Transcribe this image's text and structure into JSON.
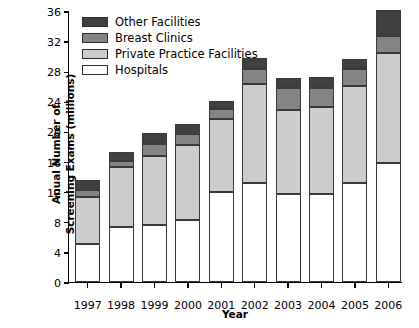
{
  "chart_data": {
    "type": "bar",
    "subtype": "stacked-vertical",
    "title": "",
    "xlabel": "Year",
    "ylabel": "Anual Number of\nScreening Exams (millions)",
    "categories": [
      "1997",
      "1998",
      "1999",
      "2000",
      "2001",
      "2002",
      "2003",
      "2004",
      "2005",
      "2006"
    ],
    "ylim": [
      0,
      36
    ],
    "yticks": [
      "0",
      "4",
      "8",
      "12",
      "16",
      "20",
      "24",
      "28",
      "32",
      "36"
    ],
    "ytick_values": [
      0,
      4,
      8,
      12,
      16,
      20,
      24,
      28,
      32,
      36
    ],
    "grid": false,
    "legend_position": "top-left",
    "series": [
      {
        "name": "Hospitals",
        "color": "#ffffff",
        "values": [
          5.0,
          7.3,
          7.6,
          8.2,
          11.9,
          13.2,
          11.7,
          11.7,
          13.2,
          15.8
        ]
      },
      {
        "name": "Private Practice Facilities",
        "color": "#cccccc",
        "values": [
          6.3,
          8.0,
          9.2,
          10.0,
          9.7,
          13.1,
          11.2,
          11.6,
          12.8,
          14.6
        ]
      },
      {
        "name": "Breast Clinics",
        "color": "#848484",
        "values": [
          0.9,
          0.8,
          1.6,
          1.4,
          1.4,
          2.0,
          2.9,
          2.5,
          2.3,
          2.3
        ]
      },
      {
        "name": "Other Facilities",
        "color": "#404040",
        "values": [
          1.4,
          1.2,
          1.4,
          1.4,
          1.1,
          1.5,
          1.3,
          1.4,
          1.3,
          3.5
        ]
      }
    ],
    "totals": [
      13.6,
      17.3,
      19.8,
      21.0,
      24.1,
      29.8,
      27.1,
      27.2,
      29.6,
      36.2
    ],
    "legend_order": [
      "Other Facilities",
      "Breast Clinics",
      "Private Practice Facilities",
      "Hospitals"
    ]
  }
}
